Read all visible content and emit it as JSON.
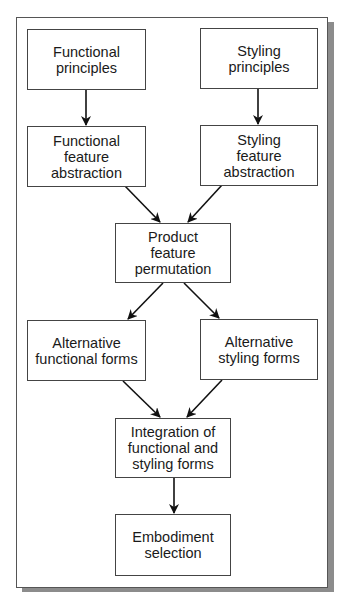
{
  "diagram": {
    "type": "flowchart",
    "nodes": [
      {
        "id": "functional-principles",
        "label": "Functional\nprinciples"
      },
      {
        "id": "styling-principles",
        "label": "Styling\nprinciples"
      },
      {
        "id": "functional-feature-abstraction",
        "label": "Functional\nfeature\nabstraction"
      },
      {
        "id": "styling-feature-abstraction",
        "label": "Styling\nfeature\nabstraction"
      },
      {
        "id": "product-feature-permutation",
        "label": "Product\nfeature\npermutation"
      },
      {
        "id": "alternative-functional-forms",
        "label": "Alternative\nfunctional forms"
      },
      {
        "id": "alternative-styling-forms",
        "label": "Alternative\nstyling forms"
      },
      {
        "id": "integration-of-forms",
        "label": "Integration of\nfunctional and\nstyling forms"
      },
      {
        "id": "embodiment-selection",
        "label": "Embodiment\nselection"
      }
    ],
    "edges": [
      {
        "from": "functional-principles",
        "to": "functional-feature-abstraction"
      },
      {
        "from": "styling-principles",
        "to": "styling-feature-abstraction"
      },
      {
        "from": "functional-feature-abstraction",
        "to": "product-feature-permutation"
      },
      {
        "from": "styling-feature-abstraction",
        "to": "product-feature-permutation"
      },
      {
        "from": "product-feature-permutation",
        "to": "alternative-functional-forms"
      },
      {
        "from": "product-feature-permutation",
        "to": "alternative-styling-forms"
      },
      {
        "from": "alternative-functional-forms",
        "to": "integration-of-forms"
      },
      {
        "from": "alternative-styling-forms",
        "to": "integration-of-forms"
      },
      {
        "from": "integration-of-forms",
        "to": "embodiment-selection"
      }
    ]
  },
  "colors": {
    "border": "#444444",
    "arrow": "#111111",
    "shadow": "#8c8c8c",
    "background": "#ffffff"
  }
}
